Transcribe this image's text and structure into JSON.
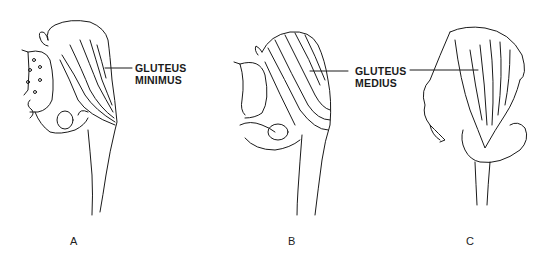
{
  "figure": {
    "panels": [
      {
        "id": "A",
        "label": "A",
        "muscle_line1": "GLUTEUS",
        "muscle_line2": "MINIMUS"
      },
      {
        "id": "B",
        "label": "B",
        "muscle_line1": "GLUTEUS",
        "muscle_line2": "MEDIUS"
      },
      {
        "id": "C",
        "label": "C"
      }
    ],
    "colors": {
      "ink": "#1a1a1a",
      "background": "#ffffff"
    }
  }
}
